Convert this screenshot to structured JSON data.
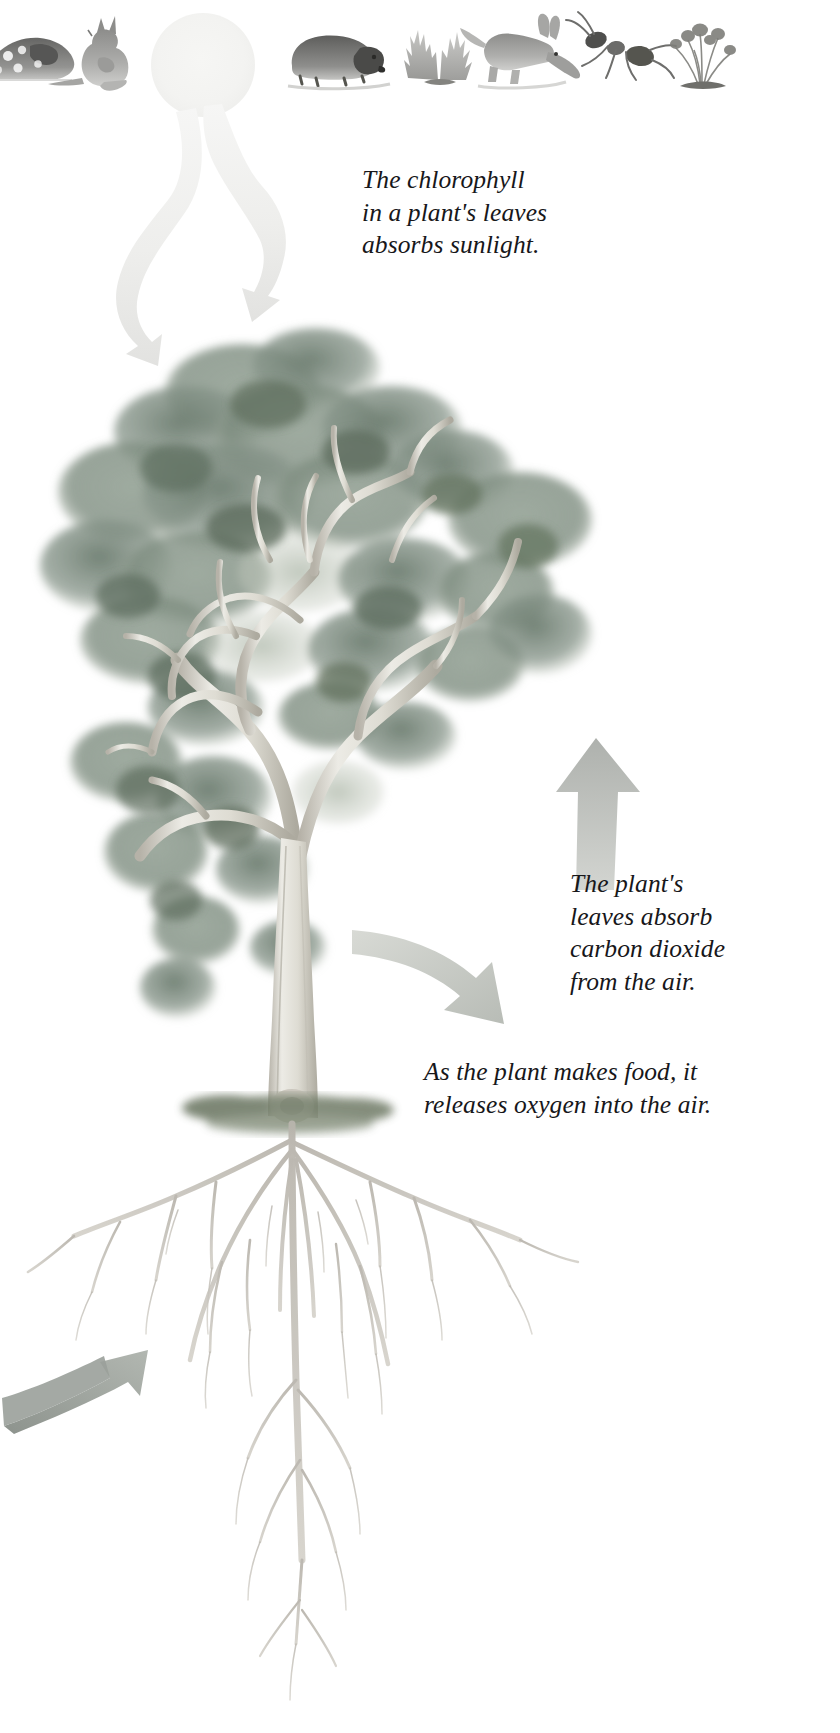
{
  "page": {
    "background_color": "#ffffff",
    "width": 840,
    "height": 1733
  },
  "captions": [
    {
      "id": "sunlight",
      "text": "The chlorophyll\nin a plant's leaves\nabsorbs sunlight.",
      "lines": [
        "The chlorophyll",
        "in a plant's leaves",
        "absorbs sunlight."
      ]
    },
    {
      "id": "carbon-dioxide",
      "text": "The plant's\nleaves absorb\ncarbon dioxide\nfrom the air.",
      "lines": [
        "The plant's",
        "leaves absorb",
        "carbon dioxide",
        "from the air."
      ]
    },
    {
      "id": "oxygen",
      "text": "As the plant makes food, it\nreleases oxygen into the air.",
      "lines": [
        "As the plant makes food, it",
        "releases oxygen into the air."
      ]
    }
  ],
  "illustration": {
    "sun": {
      "label": "sun",
      "color": "#f2f2f0"
    },
    "tree": {
      "label": "eucalyptus tree with canopy, trunk and root system",
      "foliage_colors": [
        "#8d9a8e",
        "#6f7f72",
        "#a9b3a5",
        "#5d6b60",
        "#c2c8bd"
      ],
      "trunk_color": "#d9d6cd",
      "root_color": "#b8b4ac",
      "ground_color": "#8a9184"
    },
    "arrows": [
      {
        "id": "sunlight-ray-left",
        "label": "wavy sunlight ray arrow, pointing down-left",
        "color": "#efefed",
        "direction": "down-left"
      },
      {
        "id": "sunlight-ray-right",
        "label": "wavy sunlight ray arrow, pointing down-right",
        "color": "#e9e9e7",
        "direction": "down-right"
      },
      {
        "id": "oxygen-up",
        "label": "oxygen arrow, pointing up",
        "color": "#b9bcb8",
        "direction": "up"
      },
      {
        "id": "carbon-dioxide-in",
        "label": "carbon dioxide arrow, curving down-right",
        "color": "#c6c9c3",
        "direction": "down-right"
      },
      {
        "id": "water-uptake",
        "label": "water and minerals arrow, pointing up-right",
        "color": "#9aa09a",
        "direction": "up-right"
      }
    ],
    "specimens": [
      {
        "id": "quoll",
        "label": "spotted quoll",
        "x": -18,
        "y": 16,
        "w": 92,
        "h": 62
      },
      {
        "id": "wallaby",
        "label": "rock wallaby",
        "x": 60,
        "y": 18,
        "w": 74,
        "h": 66
      },
      {
        "id": "wombat",
        "label": "wombat",
        "x": 288,
        "y": 20,
        "w": 98,
        "h": 58
      },
      {
        "id": "saltbush",
        "label": "saltbush shrub",
        "x": 404,
        "y": 20,
        "w": 70,
        "h": 62
      },
      {
        "id": "bilby",
        "label": "bilby",
        "x": 478,
        "y": 14,
        "w": 82,
        "h": 66
      },
      {
        "id": "ant",
        "label": "ant",
        "x": 578,
        "y": 24,
        "w": 76,
        "h": 52
      },
      {
        "id": "flowering-grass",
        "label": "flowering tussock grass",
        "x": 660,
        "y": 14,
        "w": 80,
        "h": 68
      }
    ]
  }
}
